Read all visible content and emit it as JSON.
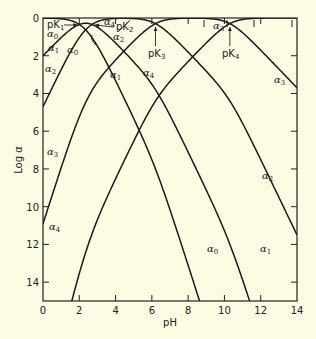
{
  "chart_data": {
    "type": "line",
    "title": "",
    "xlabel": "pH",
    "ylabel": "Log α",
    "xlim": [
      0,
      14
    ],
    "ylim": [
      0,
      15
    ],
    "y_axis_inverted": true,
    "y_axis_note": "tick labels show -log α increasing downward",
    "x_ticks": [
      "0",
      "2",
      "4",
      "6",
      "8",
      "10",
      "12",
      "14"
    ],
    "y_ticks": [
      "0",
      "2",
      "4",
      "6",
      "8",
      "10",
      "12",
      "14"
    ],
    "grid": false,
    "legend": "none (curves labeled inline)",
    "pK": [
      2.0,
      2.7,
      6.2,
      10.3
    ],
    "pK_labels": [
      {
        "name": "pK",
        "sub": "1",
        "pH": 2.0
      },
      {
        "name": "pK",
        "sub": "2",
        "pH": 2.7
      },
      {
        "name": "pK",
        "sub": "3",
        "pH": 6.2
      },
      {
        "name": "pK",
        "sub": "4",
        "pH": 10.3
      }
    ],
    "series": [
      {
        "name": "α0",
        "sub": "0",
        "description": "fully protonated species",
        "x_sample": [
          0,
          2,
          4,
          6,
          8,
          8.4
        ],
        "y_sample_neg_log": [
          0.0,
          0.3,
          2.3,
          5.0,
          13.4,
          15.0
        ]
      },
      {
        "name": "α1",
        "sub": "1",
        "x_sample": [
          0,
          2,
          4,
          6,
          8,
          10,
          11.2
        ],
        "y_sample_neg_log": [
          2.0,
          0.3,
          0.3,
          3.0,
          9.4,
          14.8,
          15.0
        ]
      },
      {
        "name": "α2",
        "sub": "2",
        "x_sample": [
          0,
          2,
          4,
          6,
          8,
          10,
          12,
          14
        ],
        "y_sample_neg_log": [
          4.7,
          1.0,
          0.1,
          0.4,
          1.8,
          3.7,
          7.5,
          11.5
        ]
      },
      {
        "name": "α3",
        "sub": "3",
        "x_sample": [
          0,
          2,
          4,
          6,
          8,
          10,
          12,
          14
        ],
        "y_sample_neg_log": [
          10.9,
          5.3,
          2.2,
          0.6,
          0.0,
          0.1,
          1.7,
          3.7
        ]
      },
      {
        "name": "α4",
        "sub": "4",
        "x_sample": [
          1.55,
          2,
          4,
          6,
          8,
          10,
          12,
          14
        ],
        "y_sample_neg_log": [
          15.0,
          13.3,
          8.2,
          4.6,
          2.3,
          0.5,
          0.0,
          0.0
        ]
      }
    ],
    "labels": {
      "a": "α",
      "curve_labels": [
        {
          "series": "α0",
          "sub": "0"
        },
        {
          "series": "α1",
          "sub": "1"
        },
        {
          "series": "α2",
          "sub": "2"
        },
        {
          "series": "α0",
          "sub": "0"
        },
        {
          "series": "α2",
          "sub": "2"
        },
        {
          "series": "α1",
          "sub": "1"
        },
        {
          "series": "α4",
          "sub": "4"
        },
        {
          "series": "α3",
          "sub": "3"
        },
        {
          "series": "α4",
          "sub": "4"
        },
        {
          "series": "α3",
          "sub": "3"
        },
        {
          "series": "α3",
          "sub": "3"
        },
        {
          "series": "α2",
          "sub": "2"
        },
        {
          "series": "α4",
          "sub": "4"
        },
        {
          "series": "α0",
          "sub": "0"
        },
        {
          "series": "α1",
          "sub": "1"
        }
      ]
    }
  }
}
